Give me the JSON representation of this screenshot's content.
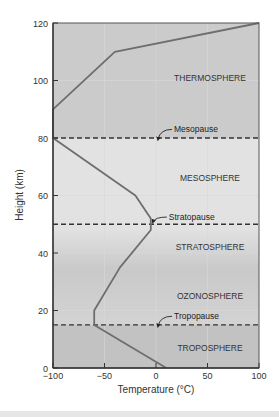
{
  "chart_data": {
    "type": "line",
    "title": "",
    "xlabel": "Temperature (°C)",
    "ylabel": "Height (km)",
    "xlim": [
      -100,
      100
    ],
    "ylim": [
      0,
      120
    ],
    "x_ticks": [
      -100,
      -50,
      0,
      50,
      100
    ],
    "x_tick_labels": [
      "−100",
      "−50",
      "0",
      "50",
      "100"
    ],
    "y_ticks": [
      0,
      20,
      40,
      60,
      80,
      100,
      120
    ],
    "y_tick_labels": [
      "0",
      "20",
      "40",
      "60",
      "80",
      "100",
      "120"
    ],
    "grid": true,
    "series": [
      {
        "name": "Temperature profile",
        "color": "#6e6e6e",
        "x": [
          10,
          -60,
          -60,
          -35,
          -5,
          -5,
          -20,
          -100,
          -100,
          -40,
          100
        ],
        "y": [
          0,
          15,
          20,
          35,
          48,
          52,
          60,
          80,
          90,
          110,
          120
        ]
      }
    ],
    "boundaries": [
      {
        "name": "Tropopause",
        "height": 15,
        "style": "dashed"
      },
      {
        "name": "Stratopause",
        "height": 50,
        "style": "dashed"
      },
      {
        "name": "Mesopause",
        "height": 80,
        "style": "dashed"
      }
    ],
    "layers": [
      {
        "name": "TROPOSPHERE",
        "from": 0,
        "to": 15,
        "color": "#c2c2c2",
        "label_y": 7
      },
      {
        "name": "OZONOSPHERE",
        "from": 15,
        "to": 35,
        "color": "#cdcdcd",
        "label_y": 25
      },
      {
        "name": "STRATOSPHERE",
        "from": 35,
        "to": 50,
        "color": "#e6e6e6",
        "label_y": 42
      },
      {
        "name": "MESOSPHERE",
        "from": 50,
        "to": 80,
        "color": "#e2e2e2",
        "label_y": 66
      },
      {
        "name": "THERMOSPHERE",
        "from": 80,
        "to": 120,
        "color": "#cbcbcb",
        "label_y": 101
      }
    ],
    "annotations": [
      {
        "text": "Mesopause",
        "x": 0,
        "y": 83
      },
      {
        "text": "Stratopause",
        "x": -5,
        "y": 52.5
      },
      {
        "text": "Tropopause",
        "x": 0,
        "y": 18
      }
    ],
    "legend": "none"
  }
}
